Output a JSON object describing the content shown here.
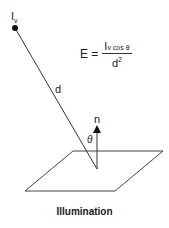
{
  "diagram": {
    "source_label": "I",
    "source_subscript": "v",
    "distance_label": "d",
    "normal_label": "n",
    "angle_label": "θ",
    "formula": {
      "lhs": "E =",
      "numerator_main": "I",
      "numerator_rest": "v cos θ",
      "denominator_base": "d",
      "denominator_exponent": "2"
    },
    "caption": "Illumination",
    "colors": {
      "line": "#333333",
      "text": "#1a1a1a",
      "background": "#ffffff"
    }
  }
}
